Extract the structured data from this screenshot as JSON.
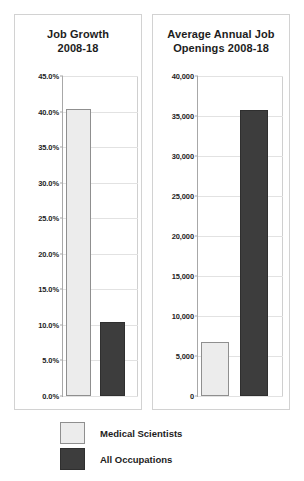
{
  "chart_data": [
    {
      "type": "bar",
      "id": "job-growth",
      "title": "Job Growth",
      "subtitle": "2008-18",
      "xlabel": "",
      "ylabel": "",
      "ylim": [
        0,
        45
      ],
      "grid": true,
      "legend_position": "below-figure",
      "categories": [
        "Medical Scientists",
        "All Occupations"
      ],
      "values": [
        40.3,
        10.4
      ],
      "ticks": [
        "0.0%",
        "5.0%",
        "10.0%",
        "15.0%",
        "20.0%",
        "25.0%",
        "30.0%",
        "35.0%",
        "40.0%",
        "45.0%"
      ],
      "tick_values": [
        0,
        5,
        10,
        15,
        20,
        25,
        30,
        35,
        40,
        45
      ]
    },
    {
      "type": "bar",
      "id": "job-openings",
      "title": "Average Annual Job",
      "subtitle": "Openings 2008-18",
      "xlabel": "",
      "ylabel": "",
      "ylim": [
        0,
        40000
      ],
      "grid": true,
      "legend_position": "below-figure",
      "categories": [
        "Medical Scientists",
        "All Occupations"
      ],
      "values": [
        6700,
        35800
      ],
      "ticks": [
        "0",
        "5,000",
        "10,000",
        "15,000",
        "20,000",
        "25,000",
        "30,000",
        "35,000",
        "40,000"
      ],
      "tick_values": [
        0,
        5000,
        10000,
        15000,
        20000,
        25000,
        30000,
        35000,
        40000
      ]
    }
  ],
  "legend": {
    "items": [
      {
        "label": "Medical Scientists",
        "color": "#ececec",
        "style": "light"
      },
      {
        "label": "All Occupations",
        "color": "#3d3d3d",
        "style": "dark"
      }
    ]
  },
  "colors": {
    "series_light": "#ececec",
    "series_dark": "#3d3d3d",
    "panel_border": "#d2d2d2",
    "axis": "#a8a8a8",
    "gridline": "#e2e2e2",
    "text": "#1d1d1d"
  }
}
